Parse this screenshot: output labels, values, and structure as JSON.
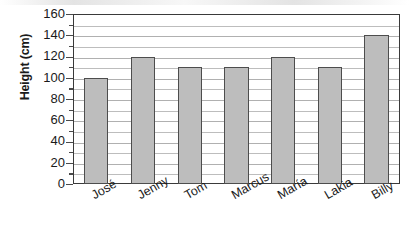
{
  "chart_data": {
    "type": "bar",
    "title": "",
    "xlabel": "",
    "ylabel": "Height (cm)",
    "categories": [
      "José",
      "Jenny",
      "Tom",
      "Marcus",
      "María",
      "Lakia",
      "Billy"
    ],
    "values": [
      100,
      120,
      110,
      110,
      120,
      110,
      140
    ],
    "ylim": [
      0,
      160
    ],
    "y_major_ticks": [
      0,
      20,
      40,
      60,
      80,
      100,
      120,
      140,
      160
    ],
    "y_minor_ticks": [
      10,
      30,
      50,
      70,
      90,
      110,
      130,
      150
    ],
    "y_tick_labels": [
      "160",
      "140",
      "120",
      "100",
      "80",
      "60",
      "40",
      "20",
      "0"
    ],
    "grid": true,
    "grid_interval": 10,
    "legend": "none",
    "bar_fill_color": "#bdbdbd",
    "bar_border_color": "#4d4d4d",
    "axis_color": "#3a3a3a",
    "gridline_color": "#bdbdbd",
    "text_color": "#1a1a1a",
    "x_label_rotation_deg": -30
  }
}
